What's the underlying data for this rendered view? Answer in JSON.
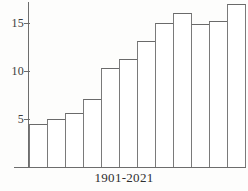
{
  "chart_data": {
    "type": "bar",
    "title": "",
    "subtitle": "",
    "xlabel": "1901-2021",
    "ylabel": "",
    "categories": [
      "1",
      "2",
      "3",
      "4",
      "5",
      "6",
      "7",
      "8",
      "9",
      "10",
      "11",
      "12"
    ],
    "values": [
      4.5,
      5.0,
      5.6,
      7.1,
      10.3,
      11.3,
      13.1,
      15.0,
      16.0,
      14.9,
      15.2,
      17.0
    ],
    "ytick_labels": [
      "15",
      "10",
      "5"
    ],
    "ytick_values": [
      15,
      10,
      5
    ],
    "ylim": [
      0,
      17.5
    ],
    "grid": false,
    "legend": null,
    "bar_fill": "#ffffff",
    "bar_stroke": "#7a7a7a",
    "axis_color": "#6d6d6d"
  },
  "axis": {
    "x_label": "1901-2021",
    "ticks": [
      {
        "label": "15",
        "value": 15
      },
      {
        "label": "10",
        "value": 10
      },
      {
        "label": "5",
        "value": 5
      }
    ]
  }
}
